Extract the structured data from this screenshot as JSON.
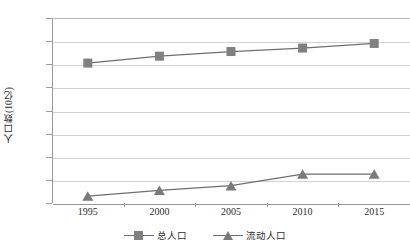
{
  "chart_data": {
    "type": "line",
    "title": "",
    "xlabel": "",
    "ylabel": "人口数(10亿)",
    "categories": [
      "1995",
      "2000",
      "2005",
      "2010",
      "2015"
    ],
    "x_tick_labels": [
      "1995",
      "2000",
      "2005",
      "2010",
      "2015"
    ],
    "y_tick_labels": [
      "0",
      "2",
      "4",
      "6",
      "8",
      "10",
      "12",
      "14",
      "16"
    ],
    "y_ticks": [
      0,
      2,
      4,
      6,
      8,
      10,
      12,
      14,
      16
    ],
    "ylim": [
      0,
      16
    ],
    "grid": true,
    "legend_position": "bottom",
    "series": [
      {
        "name": "总人口",
        "marker": "square",
        "color": "#808080",
        "line_color": "#6e6e6e",
        "values": [
          12.1,
          12.7,
          13.1,
          13.4,
          13.8
        ]
      },
      {
        "name": "流动人口",
        "marker": "triangle",
        "color": "#7a7a7a",
        "line_color": "#6e6e6e",
        "values": [
          0.6,
          1.1,
          1.5,
          2.5,
          2.5
        ]
      }
    ]
  },
  "legend": {
    "items": [
      {
        "label": "总人口",
        "marker": "square-marker-icon"
      },
      {
        "label": "流动人口",
        "marker": "triangle-marker-icon"
      }
    ]
  },
  "colors": {
    "gridline": "#d2d2d2",
    "axis": "#9a9a9a",
    "text": "#2e2e2e",
    "background": "#ffffff"
  }
}
